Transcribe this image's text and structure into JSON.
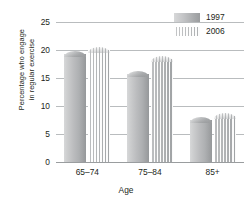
{
  "chart_data": {
    "type": "bar",
    "title": "",
    "xlabel": "Age",
    "ylabel": "Percentage who engage in regular exercise",
    "ylabel_line1": "Percentage who engage",
    "ylabel_line2": "in regular exercise",
    "categories": [
      "65–74",
      "75–84",
      "85+"
    ],
    "series": [
      {
        "name": "1997",
        "values": [
          19.8,
          16.2,
          8.1
        ],
        "color": "#b4b6b8"
      },
      {
        "name": "2006",
        "values": [
          20.6,
          18.9,
          8.7
        ],
        "color": "#d9dadb"
      }
    ],
    "ylim": [
      0,
      25
    ],
    "yticks": [
      0,
      5,
      10,
      15,
      20,
      25
    ],
    "ytick_labels": [
      "0",
      "5",
      "10",
      "15",
      "20",
      "25"
    ],
    "grid": true,
    "legend_position": "top-right"
  },
  "legend": {
    "items": [
      {
        "label": "1997"
      },
      {
        "label": "2006"
      }
    ]
  },
  "axes": {
    "x_title": "Age",
    "y_title_line1": "Percentage who engage",
    "y_title_line2": "in regular exercise"
  }
}
